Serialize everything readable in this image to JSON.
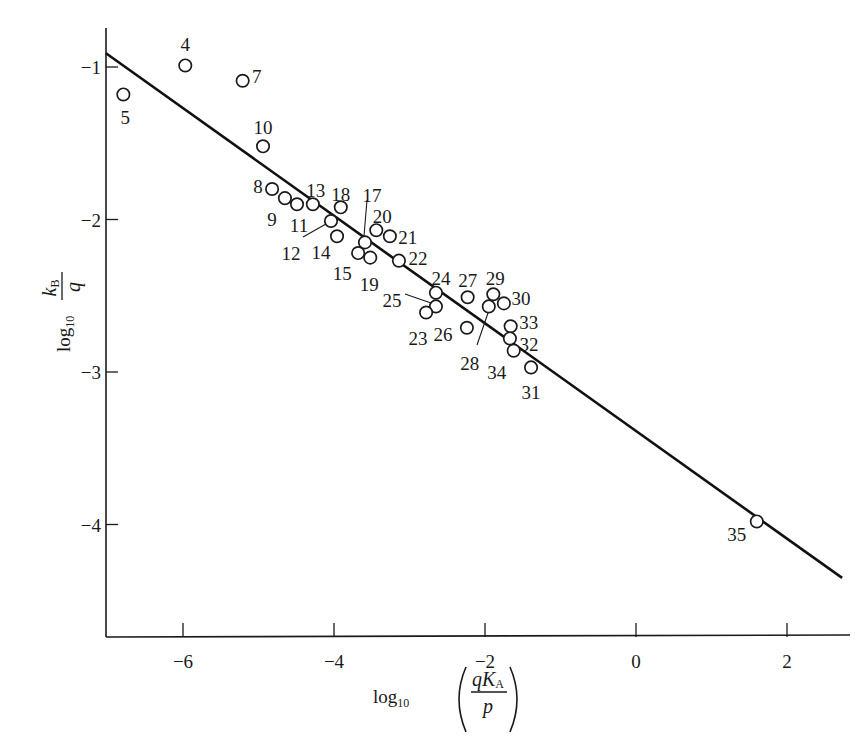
{
  "chart_data": {
    "type": "scatter",
    "title": "",
    "xlabel": "log10 (qK_A / p)",
    "ylabel": "log10 (k_B / q)",
    "xlabel_parts": {
      "log": "log",
      "sub": "10",
      "num_q": "q",
      "num_K": "K",
      "num_sub": "A",
      "den": "p"
    },
    "ylabel_parts": {
      "log": "log",
      "sub": "10",
      "num_k": "k",
      "num_sub": "B",
      "den": "q"
    },
    "xlim": [
      -7.0,
      2.8
    ],
    "ylim": [
      -4.75,
      -0.75
    ],
    "grid": false,
    "legend": null,
    "x_ticks": [
      -6,
      -4,
      -2,
      0,
      2
    ],
    "x_tick_labels": [
      "−6",
      "−4",
      "−2",
      "0",
      "2"
    ],
    "y_ticks": [
      -1,
      -2,
      -3,
      -4
    ],
    "y_tick_labels": [
      "−1",
      "−2",
      "−3",
      "−4"
    ],
    "points": [
      {
        "id": "4",
        "x": -5.97,
        "y": -0.99
      },
      {
        "id": "5",
        "x": -6.79,
        "y": -1.18
      },
      {
        "id": "7",
        "x": -5.21,
        "y": -1.09
      },
      {
        "id": "10",
        "x": -4.94,
        "y": -1.52
      },
      {
        "id": "8",
        "x": -4.82,
        "y": -1.8
      },
      {
        "id": "9",
        "x": -4.65,
        "y": -1.86
      },
      {
        "id": "11",
        "x": -4.49,
        "y": -1.9
      },
      {
        "id": "13",
        "x": -4.28,
        "y": -1.9
      },
      {
        "id": "18",
        "x": -3.91,
        "y": -1.92
      },
      {
        "id": "12",
        "x": -4.04,
        "y": -2.01
      },
      {
        "id": "14",
        "x": -3.96,
        "y": -2.11
      },
      {
        "id": "17",
        "x": -3.59,
        "y": -2.15
      },
      {
        "id": "20",
        "x": -3.44,
        "y": -2.07
      },
      {
        "id": "21",
        "x": -3.26,
        "y": -2.11
      },
      {
        "id": "15",
        "x": -3.68,
        "y": -2.22
      },
      {
        "id": "19",
        "x": -3.52,
        "y": -2.25
      },
      {
        "id": "22",
        "x": -3.14,
        "y": -2.27
      },
      {
        "id": "24",
        "x": -2.65,
        "y": -2.48
      },
      {
        "id": "25",
        "x": -2.65,
        "y": -2.57
      },
      {
        "id": "23",
        "x": -2.78,
        "y": -2.61
      },
      {
        "id": "27",
        "x": -2.23,
        "y": -2.51
      },
      {
        "id": "29",
        "x": -1.89,
        "y": -2.49
      },
      {
        "id": "30",
        "x": -1.75,
        "y": -2.55
      },
      {
        "id": "28",
        "x": -1.95,
        "y": -2.57
      },
      {
        "id": "26",
        "x": -2.24,
        "y": -2.71
      },
      {
        "id": "33",
        "x": -1.66,
        "y": -2.7
      },
      {
        "id": "32",
        "x": -1.67,
        "y": -2.78
      },
      {
        "id": "34",
        "x": -1.62,
        "y": -2.86
      },
      {
        "id": "31",
        "x": -1.39,
        "y": -2.97
      },
      {
        "id": "35",
        "x": 1.6,
        "y": -3.98
      }
    ],
    "fit_line": {
      "x": [
        -7.02,
        2.73
      ],
      "y": [
        -0.91,
        -4.35
      ]
    }
  },
  "layout": {
    "plot": {
      "x0_px": 636,
      "px_per_x": 75.5,
      "ym1_px": 67,
      "px_per_y": 152.5,
      "axis_left_px": 106,
      "axis_bottom_px": 637,
      "axis_right_px": 850,
      "axis_top_px": 28
    },
    "point_radius": 6.2,
    "label_offsets": {
      "4": [
        0,
        -20,
        "middle"
      ],
      "5": [
        2,
        24,
        "middle"
      ],
      "7": [
        14,
        -4,
        "middle"
      ],
      "10": [
        0,
        -18,
        "middle"
      ],
      "8": [
        -14,
        -2,
        "middle"
      ],
      "9": [
        -13,
        22,
        "middle"
      ],
      "11": [
        2,
        22,
        "middle"
      ],
      "13": [
        3,
        -13,
        "middle"
      ],
      "18": [
        0,
        -12,
        "middle"
      ],
      "12": [
        -40,
        33,
        "middle"
      ],
      "14": [
        -16,
        17,
        "middle"
      ],
      "17": [
        7,
        -46,
        "middle"
      ],
      "20": [
        6,
        -13,
        "middle"
      ],
      "21": [
        18,
        2,
        "middle"
      ],
      "15": [
        -16,
        21,
        "middle"
      ],
      "19": [
        -1,
        27,
        "middle"
      ],
      "22": [
        19,
        -2,
        "middle"
      ],
      "24": [
        5,
        -14,
        "middle"
      ],
      "25": [
        -44,
        -5,
        "middle"
      ],
      "23": [
        -8,
        26,
        "middle"
      ],
      "27": [
        0,
        -16,
        "middle"
      ],
      "29": [
        2,
        -15,
        "middle"
      ],
      "30": [
        17,
        -4,
        "middle"
      ],
      "28": [
        -19,
        58,
        "middle"
      ],
      "26": [
        -24,
        7,
        "middle"
      ],
      "33": [
        18,
        -3,
        "middle"
      ],
      "32": [
        19,
        7,
        "middle"
      ],
      "34": [
        -17,
        22,
        "middle"
      ],
      "31": [
        0,
        26,
        "middle"
      ],
      "35": [
        -20,
        14,
        "middle"
      ]
    },
    "leaders": [
      {
        "for": "12",
        "from": [
          303,
          237
        ],
        "to": [
          326,
          224
        ]
      },
      {
        "for": "17",
        "from": [
          367,
          200
        ],
        "to": [
          364,
          236
        ]
      },
      {
        "for": "25",
        "from": [
          405,
          294
        ],
        "to": [
          431,
          303
        ]
      },
      {
        "for": "28",
        "from": [
          477,
          345
        ],
        "to": [
          488,
          313
        ]
      }
    ]
  }
}
